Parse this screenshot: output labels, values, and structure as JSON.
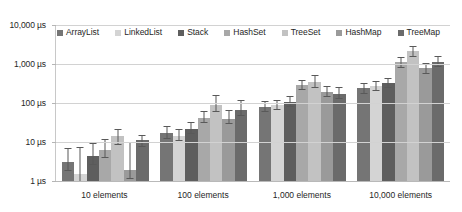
{
  "chart_data": {
    "type": "bar",
    "title": "",
    "xlabel": "",
    "ylabel": "",
    "yscale": "log",
    "ylim": [
      1,
      10000
    ],
    "grid": true,
    "legend_position": "top-inside",
    "y_ticks": [
      "1 µs",
      "10 µs",
      "100 µs",
      "1,000 µs",
      "10,000 µs"
    ],
    "y_tick_values": [
      1,
      10,
      100,
      1000,
      10000
    ],
    "categories": [
      "10 elements",
      "100 elements",
      "1,000 elements",
      "10,000 elements"
    ],
    "series": [
      {
        "name": "ArrayList",
        "color": "#757575",
        "values": [
          3.0,
          17.0,
          80.0,
          240.0
        ],
        "err_low": [
          1.9,
          13.0,
          62.0,
          185.0
        ],
        "err_high": [
          7.0,
          26.0,
          110.0,
          330.0
        ]
      },
      {
        "name": "LinkedList",
        "color": "#d4d4d4",
        "values": [
          1.5,
          14.0,
          88.0,
          270.0
        ],
        "err_low": [
          1.0,
          11.0,
          70.0,
          210.0
        ],
        "err_high": [
          7.5,
          22.0,
          118.0,
          360.0
        ]
      },
      {
        "name": "Stack",
        "color": "#5e5e5e",
        "values": [
          4.3,
          22.0,
          105.0,
          330.0
        ],
        "err_low": [
          2.8,
          17.0,
          82.0,
          260.0
        ],
        "err_high": [
          9.5,
          33.0,
          150.0,
          440.0
        ]
      },
      {
        "name": "HashSet",
        "color": "#a8a8a8",
        "values": [
          6.2,
          42.0,
          290.0,
          1100.0
        ],
        "err_low": [
          4.2,
          33.0,
          225.0,
          850.0
        ],
        "err_high": [
          12.0,
          62.0,
          400.0,
          1500.0
        ]
      },
      {
        "name": "TreeSet",
        "color": "#c2c2c2",
        "values": [
          14.0,
          88.0,
          350.0,
          2100.0
        ],
        "err_low": [
          9.0,
          62.0,
          255.0,
          1600.0
        ],
        "err_high": [
          22.0,
          160.0,
          520.0,
          2900.0
        ]
      },
      {
        "name": "HashMap",
        "color": "#9a9a9a",
        "values": [
          1.9,
          40.0,
          190.0,
          780.0
        ],
        "err_low": [
          1.2,
          31.0,
          150.0,
          600.0
        ],
        "err_high": [
          10.0,
          65.0,
          275.0,
          1080.0
        ]
      },
      {
        "name": "TreeMap",
        "color": "#6b6b6b",
        "values": [
          11.0,
          68.0,
          175.0,
          1150.0
        ],
        "err_low": [
          8.0,
          50.0,
          138.0,
          880.0
        ],
        "err_high": [
          15.5,
          120.0,
          250.0,
          1600.0
        ]
      }
    ]
  }
}
